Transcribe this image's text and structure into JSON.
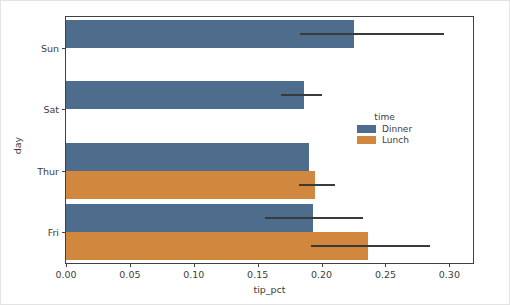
{
  "chart_data": {
    "type": "bar",
    "orientation": "horizontal",
    "title": "",
    "xlabel": "tip_pct",
    "ylabel": "day",
    "categories": [
      "Sun",
      "Sat",
      "Thur",
      "Fri"
    ],
    "xlim": [
      0.0,
      0.3185
    ],
    "xticks": [
      0.0,
      0.05,
      0.1,
      0.15,
      0.2,
      0.25,
      0.3
    ],
    "xtick_labels": [
      "0.00",
      "0.05",
      "0.10",
      "0.15",
      "0.20",
      "0.25",
      "0.30"
    ],
    "grid": false,
    "legend": {
      "title": "time",
      "position": "center right",
      "entries": [
        {
          "name": "Dinner",
          "color": "#4e6c8c"
        },
        {
          "name": "Lunch",
          "color": "#d2873f"
        }
      ]
    },
    "series": [
      {
        "name": "Dinner",
        "color": "#4e6c8c",
        "values": [
          0.225,
          0.186,
          0.19,
          0.193
        ],
        "ci_low": [
          0.183,
          0.168,
          null,
          0.156
        ],
        "ci_high": [
          0.2955,
          0.2005,
          null,
          0.2325
        ]
      },
      {
        "name": "Lunch",
        "color": "#d2873f",
        "values": [
          null,
          null,
          0.1945,
          0.236
        ],
        "ci_low": [
          null,
          null,
          0.182,
          0.192
        ],
        "ci_high": [
          null,
          null,
          0.2105,
          0.285
        ]
      }
    ]
  }
}
